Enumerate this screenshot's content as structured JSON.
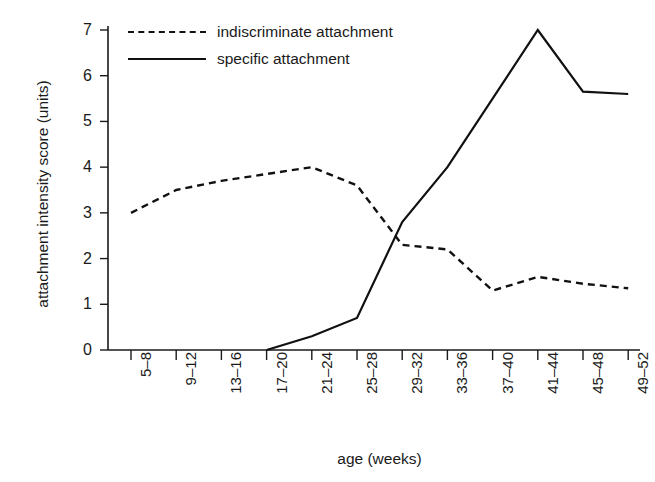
{
  "chart_data": {
    "type": "line",
    "title": "",
    "xlabel": "age (weeks)",
    "ylabel": "attachment intensity score (units)",
    "categories": [
      "5–8",
      "9–12",
      "13–16",
      "17–20",
      "21–24",
      "25–28",
      "29–32",
      "33–36",
      "37–40",
      "41–44",
      "45–48",
      "49–52"
    ],
    "ylim": [
      0,
      7
    ],
    "yticks": [
      0,
      1,
      2,
      3,
      4,
      5,
      6,
      7
    ],
    "grid": false,
    "legend_position": "top-left",
    "series": [
      {
        "name": "indiscriminate attachment",
        "style": "dashed",
        "color": "#111111",
        "values": [
          3.0,
          3.5,
          3.7,
          3.85,
          4.0,
          3.6,
          2.3,
          2.2,
          1.3,
          1.6,
          1.45,
          1.35
        ]
      },
      {
        "name": "specific attachment",
        "style": "solid",
        "color": "#111111",
        "values": [
          null,
          null,
          null,
          0.0,
          0.3,
          0.7,
          2.8,
          4.0,
          5.5,
          7.0,
          5.65,
          5.6
        ]
      }
    ]
  },
  "axes": {
    "y_title": "attachment intensity score (units)",
    "x_title": "age (weeks)",
    "y_tick_labels": [
      "0",
      "1",
      "2",
      "3",
      "4",
      "5",
      "6",
      "7"
    ],
    "x_tick_labels": [
      "5–8",
      "9–12",
      "13–16",
      "17–20",
      "21–24",
      "25–28",
      "29–32",
      "33–36",
      "37–40",
      "41–44",
      "45–48",
      "49–52"
    ]
  },
  "legend": {
    "items": [
      {
        "label": "indiscriminate attachment",
        "style": "dashed"
      },
      {
        "label": "specific attachment",
        "style": "solid"
      }
    ]
  },
  "style": {
    "axis_color": "#1a1a1a",
    "line_color": "#111111",
    "background": "#ffffff"
  }
}
